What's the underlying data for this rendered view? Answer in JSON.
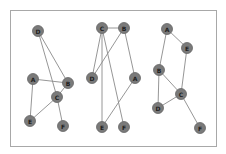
{
  "diagram": {
    "frame": {
      "border_color": "#a8a8a8"
    },
    "style": {
      "node_fill": "#7a7a7a",
      "edge_color": "#8a8a8a",
      "label_color": "#1e1e1e"
    },
    "graphs": [
      {
        "id": "graph-1",
        "nodes": [
          {
            "label": "D",
            "x": 38,
            "y": 31
          },
          {
            "label": "A",
            "x": 33,
            "y": 79
          },
          {
            "label": "B",
            "x": 68,
            "y": 83
          },
          {
            "label": "C",
            "x": 57,
            "y": 97
          },
          {
            "label": "E",
            "x": 30,
            "y": 121
          },
          {
            "label": "F",
            "x": 63,
            "y": 126
          }
        ],
        "edges": [
          [
            "D",
            "B"
          ],
          [
            "D",
            "C"
          ],
          [
            "A",
            "B"
          ],
          [
            "A",
            "E"
          ],
          [
            "B",
            "C"
          ],
          [
            "C",
            "E"
          ],
          [
            "C",
            "F"
          ]
        ]
      },
      {
        "id": "graph-2",
        "nodes": [
          {
            "label": "C",
            "x": 102,
            "y": 28
          },
          {
            "label": "B",
            "x": 124,
            "y": 28
          },
          {
            "label": "D",
            "x": 92,
            "y": 78
          },
          {
            "label": "A",
            "x": 135,
            "y": 78
          },
          {
            "label": "E",
            "x": 102,
            "y": 127
          },
          {
            "label": "F",
            "x": 124,
            "y": 127
          }
        ],
        "edges": [
          [
            "C",
            "B"
          ],
          [
            "C",
            "D"
          ],
          [
            "C",
            "E"
          ],
          [
            "C",
            "F"
          ],
          [
            "B",
            "D"
          ],
          [
            "B",
            "A"
          ],
          [
            "A",
            "E"
          ]
        ]
      },
      {
        "id": "graph-3",
        "nodes": [
          {
            "label": "A",
            "x": 167,
            "y": 29
          },
          {
            "label": "E",
            "x": 187,
            "y": 48
          },
          {
            "label": "B",
            "x": 159,
            "y": 70
          },
          {
            "label": "C",
            "x": 181,
            "y": 94
          },
          {
            "label": "D",
            "x": 158,
            "y": 108
          },
          {
            "label": "F",
            "x": 200,
            "y": 128
          }
        ],
        "edges": [
          [
            "A",
            "E"
          ],
          [
            "A",
            "B"
          ],
          [
            "E",
            "C"
          ],
          [
            "B",
            "C"
          ],
          [
            "B",
            "D"
          ],
          [
            "D",
            "C"
          ],
          [
            "C",
            "F"
          ]
        ]
      }
    ]
  }
}
